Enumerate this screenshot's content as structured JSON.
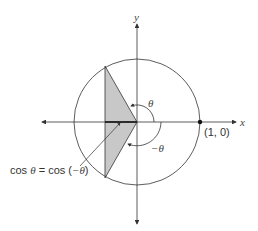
{
  "figure": {
    "axes": {
      "x_label": "x",
      "y_label": "y"
    },
    "point_label": "(1, 0)",
    "angle_labels": {
      "positive": "θ",
      "negative": "−θ"
    },
    "annotation": {
      "cos": "cos ",
      "theta": "θ",
      "eq": " = cos (",
      "neg_theta": "−θ",
      "close": ")"
    },
    "colors": {
      "shade": "#c8c8c8",
      "line": "#333333"
    }
  }
}
